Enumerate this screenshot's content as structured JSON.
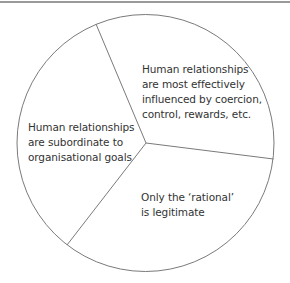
{
  "diagram": {
    "type": "circle-divided-into-three-segments",
    "colors": {
      "outline": "#7a7a7a",
      "rule": "#9a9a9a",
      "text": "#333333"
    },
    "segments": [
      {
        "id": "top-right",
        "lines": [
          "Human relationships",
          "are most effectively",
          "influenced by coercion,",
          "control, rewards, etc."
        ]
      },
      {
        "id": "left",
        "lines": [
          "Human relationships",
          "are subordinate to",
          "organisational goals"
        ]
      },
      {
        "id": "bottom-right",
        "lines": [
          "Only the ‘rational’",
          "is legitimate"
        ]
      }
    ]
  }
}
